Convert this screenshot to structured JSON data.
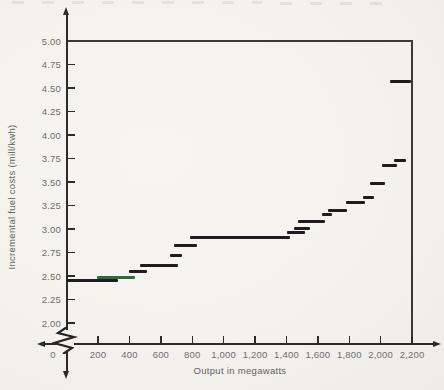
{
  "colors": {
    "background": "#f3f2ed",
    "axis": "#2b2b2b",
    "tick_label": "#6e6e6e",
    "step": "#1d1d1d",
    "step_highlight_green": "#2f6b3f"
  },
  "chart_data": {
    "type": "step",
    "title": "",
    "xlabel": "Output in megawatts",
    "ylabel": "Incremental fuel costs (mill/kwh)",
    "x_tick_labels": [
      "0",
      "200",
      "400",
      "600",
      "800",
      "1,000",
      "1,200",
      "1,400",
      "1,600",
      "1,800",
      "2,000",
      "2,200"
    ],
    "x_tick_values": [
      0,
      200,
      400,
      600,
      800,
      1000,
      1200,
      1400,
      1600,
      1800,
      2000,
      2200
    ],
    "y_tick_labels": [
      "5.00",
      "4.75",
      "4.50",
      "4.25",
      "4.00",
      "3.75",
      "3.50",
      "3.25",
      "3.00",
      "2.75",
      "2.50",
      "2.25",
      "2.00"
    ],
    "y_tick_values": [
      5.0,
      4.75,
      4.5,
      4.25,
      4.0,
      3.75,
      3.5,
      3.25,
      3.0,
      2.75,
      2.5,
      2.25,
      2.0
    ],
    "xlim": [
      0,
      2200
    ],
    "ylim": [
      2.0,
      5.0
    ],
    "y_axis_break_below": 2.0,
    "grid": false,
    "legend": null,
    "steps": [
      {
        "mw_from": 0,
        "mw_to": 325,
        "cost": 2.45,
        "color": "black"
      },
      {
        "mw_from": 195,
        "mw_to": 435,
        "cost": 2.48,
        "color": "green"
      },
      {
        "mw_from": 395,
        "mw_to": 510,
        "cost": 2.55,
        "color": "black"
      },
      {
        "mw_from": 465,
        "mw_to": 710,
        "cost": 2.61,
        "color": "black"
      },
      {
        "mw_from": 660,
        "mw_to": 735,
        "cost": 2.72,
        "color": "black"
      },
      {
        "mw_from": 685,
        "mw_to": 830,
        "cost": 2.82,
        "color": "black"
      },
      {
        "mw_from": 785,
        "mw_to": 1420,
        "cost": 2.91,
        "color": "black"
      },
      {
        "mw_from": 1405,
        "mw_to": 1520,
        "cost": 2.96,
        "color": "black"
      },
      {
        "mw_from": 1450,
        "mw_to": 1550,
        "cost": 3.01,
        "color": "black"
      },
      {
        "mw_from": 1475,
        "mw_to": 1645,
        "cost": 3.08,
        "color": "black"
      },
      {
        "mw_from": 1625,
        "mw_to": 1690,
        "cost": 3.15,
        "color": "black"
      },
      {
        "mw_from": 1665,
        "mw_to": 1785,
        "cost": 3.2,
        "color": "black"
      },
      {
        "mw_from": 1780,
        "mw_to": 1900,
        "cost": 3.28,
        "color": "black"
      },
      {
        "mw_from": 1885,
        "mw_to": 1955,
        "cost": 3.33,
        "color": "black"
      },
      {
        "mw_from": 1930,
        "mw_to": 2025,
        "cost": 3.48,
        "color": "black"
      },
      {
        "mw_from": 2010,
        "mw_to": 2105,
        "cost": 3.68,
        "color": "black"
      },
      {
        "mw_from": 2085,
        "mw_to": 2160,
        "cost": 3.73,
        "color": "black"
      },
      {
        "mw_from": 2060,
        "mw_to": 2195,
        "cost": 4.57,
        "color": "black"
      }
    ]
  }
}
